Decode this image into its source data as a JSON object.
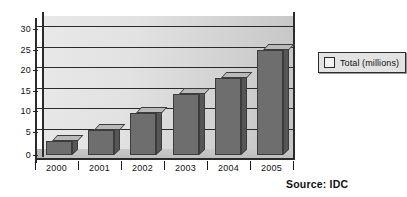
{
  "chart_data": {
    "type": "bar",
    "title": "",
    "xlabel": "",
    "ylabel": "",
    "categories": [
      "2000",
      "2001",
      "2002",
      "2003",
      "2004",
      "2005"
    ],
    "values": [
      3.5,
      6.0,
      10.3,
      14.8,
      18.9,
      25.7
    ],
    "series": [
      {
        "name": "Total (millions)",
        "values": [
          3.5,
          6.0,
          10.3,
          14.8,
          18.9,
          25.7
        ]
      }
    ],
    "ylim": [
      0,
      30
    ],
    "yticks": [
      0,
      5,
      10,
      15,
      20,
      25,
      30
    ],
    "ytick_labels": [
      "0",
      "5",
      "10",
      "15",
      "20",
      "25",
      "30"
    ],
    "grid": true,
    "legend": {
      "position": "right",
      "entries": [
        {
          "label": "Total (millions)",
          "swatch_color": "#f2f2f2"
        }
      ]
    },
    "annotations": [
      {
        "name": "source-note",
        "text": "Source: IDC"
      }
    ],
    "style": {
      "bar_face_color": "#6e6e6e",
      "bar_top_color": "#b9b9b9",
      "bar_side_color": "#565656",
      "bar_edge_color": "#3c3c3c",
      "plot_background": "#e0e0e0",
      "gridline_color": "#2b2b2b",
      "axis_color": "#2b2b2b",
      "text_color": "#111111"
    }
  },
  "source_note": "Source: IDC"
}
